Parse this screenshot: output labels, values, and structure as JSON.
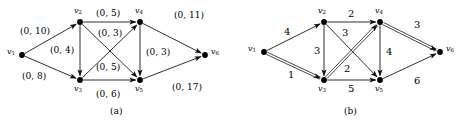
{
  "figure": {
    "panels": [
      {
        "id": "a",
        "caption": "(a)",
        "caption_pos": {
          "x": 110,
          "y": 107
        },
        "nodes": [
          {
            "id": "v1",
            "label_main": "v",
            "label_sub": "1",
            "x": 22,
            "y": 55,
            "lx": 7,
            "ly": 48
          },
          {
            "id": "v2",
            "label_main": "v",
            "label_sub": "2",
            "x": 80,
            "y": 22,
            "lx": 74,
            "ly": 7
          },
          {
            "id": "v3",
            "label_main": "v",
            "label_sub": "3",
            "x": 80,
            "y": 80,
            "lx": 74,
            "ly": 85
          },
          {
            "id": "v4",
            "label_main": "v",
            "label_sub": "4",
            "x": 140,
            "y": 22,
            "lx": 135,
            "ly": 7
          },
          {
            "id": "v5",
            "label_main": "v",
            "label_sub": "5",
            "x": 140,
            "y": 80,
            "lx": 135,
            "ly": 85
          },
          {
            "id": "v6",
            "label_main": "v",
            "label_sub": "6",
            "x": 205,
            "y": 55,
            "lx": 211,
            "ly": 48
          }
        ],
        "edges": [
          {
            "from": "v1",
            "to": "v2",
            "label": "(0, 10)",
            "lx": 20,
            "ly": 27,
            "highlight": false
          },
          {
            "from": "v1",
            "to": "v3",
            "label": "(0, 8)",
            "lx": 22,
            "ly": 72,
            "highlight": false
          },
          {
            "from": "v2",
            "to": "v3",
            "label": "(0, 4)",
            "lx": 50,
            "ly": 46,
            "highlight": false
          },
          {
            "from": "v2",
            "to": "v4",
            "label": "(0, 5)",
            "lx": 96,
            "ly": 9,
            "highlight": false
          },
          {
            "from": "v2",
            "to": "v5",
            "label": "(0, 3)",
            "lx": 98,
            "ly": 29,
            "highlight": false
          },
          {
            "from": "v3",
            "to": "v4",
            "label": "(0, 5)",
            "lx": 96,
            "ly": 63,
            "highlight": false
          },
          {
            "from": "v3",
            "to": "v5",
            "label": "(0, 6)",
            "lx": 96,
            "ly": 90,
            "highlight": false
          },
          {
            "from": "v4",
            "to": "v5",
            "label": "(0, 3)",
            "lx": 146,
            "ly": 48,
            "highlight": false
          },
          {
            "from": "v4",
            "to": "v6",
            "label": "(0, 11)",
            "lx": 174,
            "ly": 11,
            "highlight": false
          },
          {
            "from": "v5",
            "to": "v6",
            "label": "(0, 17)",
            "lx": 172,
            "ly": 83,
            "highlight": false
          }
        ]
      },
      {
        "id": "b",
        "caption": "(b)",
        "caption_pos": {
          "x": 110,
          "y": 107
        },
        "nodes": [
          {
            "id": "v1",
            "label_main": "v",
            "label_sub": "1",
            "x": 30,
            "y": 52,
            "lx": 14,
            "ly": 45
          },
          {
            "id": "v2",
            "label_main": "v",
            "label_sub": "2",
            "x": 90,
            "y": 22,
            "lx": 84,
            "ly": 7
          },
          {
            "id": "v3",
            "label_main": "v",
            "label_sub": "3",
            "x": 90,
            "y": 80,
            "lx": 84,
            "ly": 85
          },
          {
            "id": "v4",
            "label_main": "v",
            "label_sub": "4",
            "x": 146,
            "y": 22,
            "lx": 141,
            "ly": 7
          },
          {
            "id": "v5",
            "label_main": "v",
            "label_sub": "5",
            "x": 146,
            "y": 80,
            "lx": 141,
            "ly": 85
          },
          {
            "id": "v6",
            "label_main": "v",
            "label_sub": "6",
            "x": 206,
            "y": 52,
            "lx": 212,
            "ly": 45
          }
        ],
        "edges": [
          {
            "from": "v1",
            "to": "v2",
            "label": "4",
            "lx": 50,
            "ly": 27,
            "highlight": false
          },
          {
            "from": "v1",
            "to": "v3",
            "label": "1",
            "lx": 54,
            "ly": 70,
            "highlight": true
          },
          {
            "from": "v2",
            "to": "v3",
            "label": "3",
            "lx": 80,
            "ly": 46,
            "highlight": false
          },
          {
            "from": "v2",
            "to": "v4",
            "label": "2",
            "lx": 114,
            "ly": 9,
            "highlight": false
          },
          {
            "from": "v2",
            "to": "v5",
            "label": "3",
            "lx": 108,
            "ly": 28,
            "highlight": false
          },
          {
            "from": "v3",
            "to": "v4",
            "label": "2",
            "lx": 110,
            "ly": 64,
            "highlight": true
          },
          {
            "from": "v3",
            "to": "v5",
            "label": "5",
            "lx": 114,
            "ly": 84,
            "highlight": false
          },
          {
            "from": "v4",
            "to": "v5",
            "label": "4",
            "lx": 152,
            "ly": 47,
            "highlight": false
          },
          {
            "from": "v4",
            "to": "v6",
            "label": "3",
            "lx": 180,
            "ly": 20,
            "highlight": true
          },
          {
            "from": "v5",
            "to": "v6",
            "label": "6",
            "lx": 180,
            "ly": 76,
            "highlight": false
          }
        ]
      }
    ],
    "style": {
      "edge_color": "#1a1a1a",
      "node_color": "#000000",
      "background": "#ffffff"
    }
  }
}
